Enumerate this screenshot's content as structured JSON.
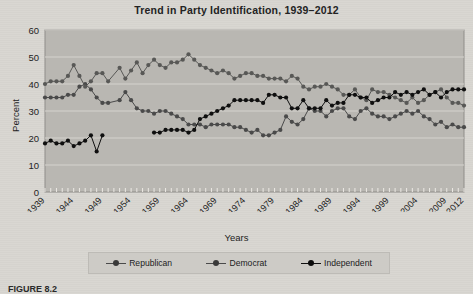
{
  "figure": {
    "title": "Trend in Party Identification, 1939–2012",
    "caption": "FIGURE 8.2",
    "background_color": "#d8d6d1",
    "plot_background_color": "#b9b7b2"
  },
  "chart_data": {
    "type": "line",
    "title": "Trend in Party Identification, 1939–2012",
    "xlabel": "Years",
    "ylabel": "Percent",
    "xlim": [
      1939,
      2012
    ],
    "ylim": [
      0,
      60
    ],
    "ytick_values": [
      0,
      10,
      20,
      30,
      40,
      50,
      60
    ],
    "ytick_labels": [
      "0",
      "10",
      "20",
      "30",
      "40",
      "50",
      "60"
    ],
    "xtick_labels": [
      "1939",
      "1944",
      "1949",
      "1954",
      "1959",
      "1964",
      "1969",
      "1974",
      "1979",
      "1984",
      "1989",
      "1994",
      "1999",
      "2004",
      "2009",
      "2012"
    ],
    "xtick_values": [
      1939,
      1944,
      1949,
      1954,
      1959,
      1964,
      1969,
      1974,
      1979,
      1984,
      1989,
      1994,
      1999,
      2004,
      2009,
      2012
    ],
    "minor_ticks": "every year",
    "grid": true,
    "grid_axis": "y",
    "legend_position": "below",
    "series": [
      {
        "name": "Republican",
        "color": "#4a4a4a",
        "x": [
          1939,
          1940,
          1941,
          1942,
          1943,
          1944,
          1945,
          1946,
          1947,
          1948,
          1949,
          1950,
          1952,
          1953,
          1954,
          1955,
          1956,
          1957,
          1958,
          1959,
          1960,
          1961,
          1962,
          1963,
          1964,
          1965,
          1966,
          1967,
          1968,
          1969,
          1970,
          1971,
          1972,
          1973,
          1974,
          1975,
          1976,
          1977,
          1978,
          1979,
          1980,
          1981,
          1982,
          1983,
          1984,
          1985,
          1986,
          1987,
          1988,
          1989,
          1990,
          1991,
          1992,
          1993,
          1994,
          1995,
          1996,
          1997,
          1998,
          1999,
          2000,
          2001,
          2002,
          2003,
          2004,
          2005,
          2006,
          2007,
          2008,
          2009,
          2010,
          2011,
          2012
        ],
        "values": [
          35,
          35,
          35,
          35,
          36,
          36,
          39,
          40,
          38,
          35,
          33,
          33,
          34,
          37,
          34,
          31,
          30,
          30,
          29,
          30,
          30,
          29,
          28,
          27,
          25,
          25,
          25,
          24,
          25,
          25,
          25,
          25,
          24,
          24,
          23,
          22,
          23,
          21,
          21,
          22,
          23,
          28,
          26,
          25,
          27,
          31,
          30,
          30,
          28,
          30,
          31,
          31,
          28,
          27,
          30,
          31,
          29,
          28,
          28,
          27,
          28,
          29,
          30,
          29,
          30,
          28,
          27,
          25,
          26,
          24,
          25,
          24,
          24
        ]
      },
      {
        "name": "Democrat",
        "color": "#585856",
        "x": [
          1939,
          1940,
          1941,
          1942,
          1943,
          1944,
          1945,
          1946,
          1947,
          1948,
          1949,
          1950,
          1952,
          1953,
          1954,
          1955,
          1956,
          1957,
          1958,
          1959,
          1960,
          1961,
          1962,
          1963,
          1964,
          1965,
          1966,
          1967,
          1968,
          1969,
          1970,
          1971,
          1972,
          1973,
          1974,
          1975,
          1976,
          1977,
          1978,
          1979,
          1980,
          1981,
          1982,
          1983,
          1984,
          1985,
          1986,
          1987,
          1988,
          1989,
          1990,
          1991,
          1992,
          1993,
          1994,
          1995,
          1996,
          1997,
          1998,
          1999,
          2000,
          2001,
          2002,
          2003,
          2004,
          2005,
          2006,
          2007,
          2008,
          2009,
          2010,
          2011,
          2012
        ],
        "values": [
          40,
          41,
          41,
          41,
          43,
          47,
          43,
          39,
          41,
          44,
          44,
          41,
          46,
          42,
          45,
          48,
          44,
          47,
          49,
          47,
          46,
          48,
          48,
          49,
          51,
          49,
          47,
          46,
          45,
          44,
          45,
          44,
          42,
          43,
          44,
          44,
          43,
          43,
          42,
          42,
          42,
          41,
          43,
          42,
          39,
          38,
          39,
          39,
          40,
          39,
          38,
          36,
          36,
          38,
          35,
          34,
          38,
          37,
          37,
          36,
          35,
          34,
          33,
          35,
          33,
          34,
          36,
          37,
          38,
          35,
          33,
          33,
          32
        ]
      },
      {
        "name": "Independent",
        "color": "#0f0f0f",
        "x": [
          1939,
          1940,
          1941,
          1942,
          1943,
          1944,
          1945,
          1946,
          1947,
          1948,
          1949,
          1958,
          1959,
          1960,
          1961,
          1962,
          1963,
          1964,
          1965,
          1966,
          1967,
          1968,
          1969,
          1970,
          1971,
          1972,
          1973,
          1974,
          1975,
          1976,
          1977,
          1978,
          1979,
          1980,
          1981,
          1982,
          1983,
          1984,
          1985,
          1986,
          1987,
          1988,
          1989,
          1990,
          1991,
          1992,
          1993,
          1994,
          1995,
          1996,
          1997,
          1998,
          1999,
          2000,
          2001,
          2002,
          2003,
          2004,
          2005,
          2006,
          2007,
          2008,
          2009,
          2010,
          2011,
          2012
        ],
        "values": [
          18,
          19,
          18,
          18,
          19,
          17,
          18,
          19,
          21,
          15,
          21,
          22,
          22,
          23,
          23,
          23,
          23,
          22,
          23,
          27,
          28,
          29,
          30,
          31,
          32,
          34,
          34,
          34,
          34,
          34,
          33,
          36,
          36,
          35,
          35,
          31,
          31,
          34,
          31,
          31,
          31,
          34,
          32,
          33,
          33,
          36,
          36,
          35,
          35,
          33,
          34,
          35,
          35,
          37,
          36,
          37,
          36,
          37,
          38,
          36,
          37,
          35,
          37,
          38,
          38,
          38
        ]
      }
    ]
  }
}
